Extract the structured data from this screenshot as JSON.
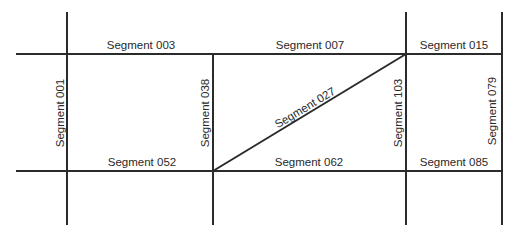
{
  "diagram": {
    "type": "road-segment-map",
    "lines": {
      "horizontal": [
        {
          "id": "h-top",
          "x1": 16,
          "y1": 54,
          "x2": 502,
          "y2": 54
        },
        {
          "id": "h-bottom",
          "x1": 16,
          "y1": 171,
          "x2": 502,
          "y2": 171
        }
      ],
      "vertical": [
        {
          "id": "v-1",
          "x1": 67,
          "y1": 12,
          "x2": 67,
          "y2": 225
        },
        {
          "id": "v-2",
          "x1": 213,
          "y1": 54,
          "x2": 213,
          "y2": 225
        },
        {
          "id": "v-3",
          "x1": 406,
          "y1": 12,
          "x2": 406,
          "y2": 225
        },
        {
          "id": "v-4",
          "x1": 502,
          "y1": 12,
          "x2": 502,
          "y2": 225
        }
      ],
      "diagonal": [
        {
          "id": "d-1",
          "x1": 213,
          "y1": 171,
          "x2": 406,
          "y2": 54
        }
      ]
    },
    "segments": [
      {
        "id": "003",
        "label": "Segment 003",
        "x": 141,
        "y": 49,
        "rotate": 0
      },
      {
        "id": "007",
        "label": "Segment 007",
        "x": 310,
        "y": 49,
        "rotate": 0
      },
      {
        "id": "015",
        "label": "Segment 015",
        "x": 454,
        "y": 49,
        "rotate": 0
      },
      {
        "id": "001",
        "label": "Segment 001",
        "x": 64,
        "y": 113,
        "rotate": -90
      },
      {
        "id": "038",
        "label": "Segment 038",
        "x": 209,
        "y": 113,
        "rotate": -90
      },
      {
        "id": "027",
        "label": "Segment 027",
        "x": 307,
        "y": 111,
        "rotate": -31
      },
      {
        "id": "103",
        "label": "Segment 103",
        "x": 402,
        "y": 113,
        "rotate": -90
      },
      {
        "id": "079",
        "label": "Segment 079",
        "x": 496,
        "y": 111,
        "rotate": -90
      },
      {
        "id": "052",
        "label": "Segment 052",
        "x": 142,
        "y": 166,
        "rotate": 0
      },
      {
        "id": "062",
        "label": "Segment 062",
        "x": 309,
        "y": 166,
        "rotate": 0
      },
      {
        "id": "085",
        "label": "Segment 085",
        "x": 454,
        "y": 166,
        "rotate": 0
      }
    ]
  }
}
